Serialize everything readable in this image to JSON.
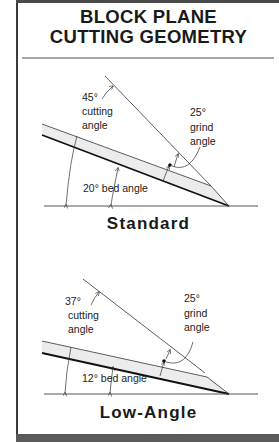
{
  "title": {
    "line1": "BLOCK PLANE",
    "line2": "CUTTING GEOMETRY"
  },
  "diagrams": [
    {
      "name": "Standard",
      "caption": "Standard",
      "cutting_angle": {
        "value": "45°",
        "label1": "cutting",
        "label2": "angle"
      },
      "grind_angle": {
        "value": "25°",
        "label1": "grind",
        "label2": "angle"
      },
      "bed_angle": {
        "label": "20° bed angle"
      }
    },
    {
      "name": "Low-Angle",
      "caption": "Low-Angle",
      "cutting_angle": {
        "value": "37°",
        "label1": "cutting",
        "label2": "angle"
      },
      "grind_angle": {
        "value": "25°",
        "label1": "grind",
        "label2": "angle"
      },
      "bed_angle": {
        "label": "12° bed angle"
      }
    }
  ],
  "colors": {
    "line": "#222222",
    "blade_fill": "#ececec",
    "frame": "#4a4a4a",
    "divider": "#a9a9a9"
  }
}
